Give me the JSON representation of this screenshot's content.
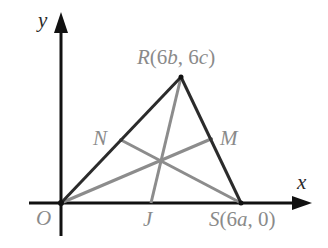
{
  "diagram": {
    "type": "geometry-triangle-medians",
    "axes": {
      "x_label": "x",
      "y_label": "y"
    },
    "origin": {
      "label": "O"
    },
    "vertices": [
      {
        "name": "R",
        "label": "R(6b, 6c)",
        "label_parts": [
          "R",
          "(6",
          "b",
          ", 6",
          "c",
          ")"
        ]
      },
      {
        "name": "S",
        "label": "S(6a, 0)",
        "label_parts": [
          "S",
          "(6",
          "a",
          ", 0)"
        ]
      },
      {
        "name": "O",
        "label": "O"
      }
    ],
    "midpoints": [
      {
        "name": "N",
        "label": "N",
        "on_side": "OR"
      },
      {
        "name": "M",
        "label": "M",
        "on_side": "RS"
      },
      {
        "name": "J",
        "label": "J",
        "on_side": "OS"
      }
    ],
    "medians": [
      "O-M",
      "S-N",
      "R-J"
    ],
    "colors": {
      "axes": "#111111",
      "triangle": "#2b2b2b",
      "medians": "#8c8c8c",
      "labels_dark": "#2a2a2a",
      "labels_gray": "#8a8a8a"
    }
  }
}
